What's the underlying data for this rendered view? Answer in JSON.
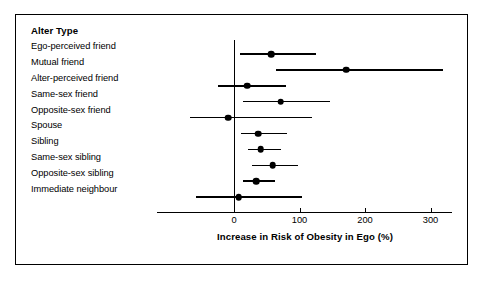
{
  "figure": {
    "column_header": "Alter Type",
    "frame_color": "#000000",
    "background_color": "#ffffff",
    "mark_color": "#000000"
  },
  "chart_data": {
    "type": "scatter",
    "subtype": "forest-plot",
    "title": "",
    "xlabel": "Increase in Risk of Obesity in Ego (%)",
    "ylabel": "Alter Type",
    "xlim": [
      -75,
      330
    ],
    "xticks": [
      0,
      100,
      200,
      300
    ],
    "xtick_labels": [
      "0",
      "100",
      "200",
      "300"
    ],
    "grid": false,
    "legend": null,
    "reference_line": 0,
    "categories": [
      "Ego-perceived friend",
      "Mutual friend",
      "Alter-perceived friend",
      "Same-sex friend",
      "Opposite-sex friend",
      "Spouse",
      "Sibling",
      "Same-sex sibling",
      "Opposite-sex sibling",
      "Immediate neighbour"
    ],
    "values": [
      57,
      171,
      20,
      71,
      -9,
      37,
      41,
      59,
      34,
      7
    ],
    "ci_low": [
      9,
      64,
      -25,
      13,
      -67,
      11,
      21,
      27,
      14,
      -58
    ],
    "ci_high": [
      125,
      319,
      79,
      147,
      119,
      81,
      71,
      98,
      62,
      104
    ],
    "points": [
      {
        "category": "Ego-perceived friend",
        "value": 57,
        "ci_low": 9,
        "ci_high": 125
      },
      {
        "category": "Mutual friend",
        "value": 171,
        "ci_low": 64,
        "ci_high": 319
      },
      {
        "category": "Alter-perceived friend",
        "value": 20,
        "ci_low": -25,
        "ci_high": 79
      },
      {
        "category": "Same-sex friend",
        "value": 71,
        "ci_low": 13,
        "ci_high": 147
      },
      {
        "category": "Opposite-sex friend",
        "value": -9,
        "ci_low": -67,
        "ci_high": 119
      },
      {
        "category": "Spouse",
        "value": 37,
        "ci_low": 11,
        "ci_high": 81
      },
      {
        "category": "Sibling",
        "value": 41,
        "ci_low": 21,
        "ci_high": 71
      },
      {
        "category": "Same-sex sibling",
        "value": 59,
        "ci_low": 27,
        "ci_high": 98
      },
      {
        "category": "Opposite-sex sibling",
        "value": 34,
        "ci_low": 14,
        "ci_high": 62
      },
      {
        "category": "Immediate neighbour",
        "value": 7,
        "ci_low": -58,
        "ci_high": 104
      }
    ]
  },
  "layout": {
    "x_origin_px": 234,
    "px_per_unit": 0.655,
    "first_row_y_px": 54,
    "row_step_px": 15.9,
    "axis_y_px": 212,
    "axis_left_px": 157,
    "axis_right_px": 452,
    "tick_label_y_px": 215,
    "axis_title_y_px": 231,
    "axis_title_center_px": 305,
    "zero_line_top_px": 40,
    "zero_line_bottom_px": 212
  }
}
